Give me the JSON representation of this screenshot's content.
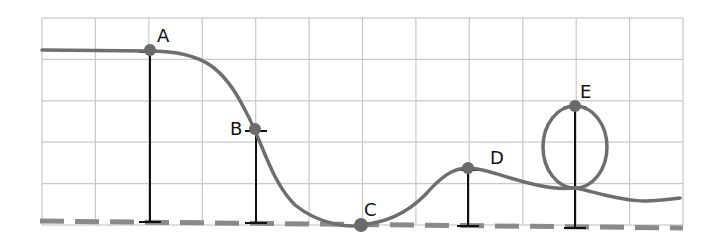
{
  "diagram": {
    "type": "roller-coaster-track-heights",
    "colors": {
      "grid": "#c8c8c8",
      "track": "#6e6e6e",
      "ground": "#8a8a8a",
      "point": "#6a6a6a",
      "height_marker": "#111111",
      "label": "#111111"
    },
    "grid": {
      "columns": 12,
      "rows": 5
    },
    "ground_line": {
      "style": "dashed"
    },
    "points": [
      {
        "label": "A",
        "description": "start plateau, highest point"
      },
      {
        "label": "B",
        "description": "midway down the first drop"
      },
      {
        "label": "C",
        "description": "bottom of drop, at ground level"
      },
      {
        "label": "D",
        "description": "top of small hill"
      },
      {
        "label": "E",
        "description": "top of vertical loop"
      }
    ]
  }
}
